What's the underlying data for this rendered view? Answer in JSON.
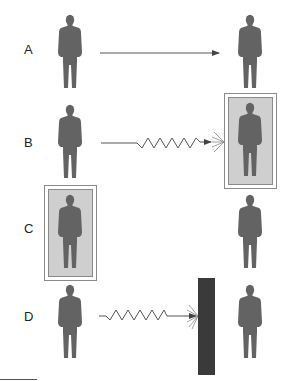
{
  "rows": [
    {
      "label": "A",
      "connector": "straight-arrow",
      "protection": "none"
    },
    {
      "label": "B",
      "connector": "zigzag-arrow",
      "protection": "shield-around-target"
    },
    {
      "label": "C",
      "connector": "none",
      "protection": "shield-around-source"
    },
    {
      "label": "D",
      "connector": "zigzag-arrow",
      "protection": "wall-barrier"
    }
  ],
  "colors": {
    "figure": "#636363",
    "shield_fill": "#cfcfcf",
    "shield_border": "#8a8a8a",
    "wall": "#3a3a3a",
    "line": "#555555"
  }
}
